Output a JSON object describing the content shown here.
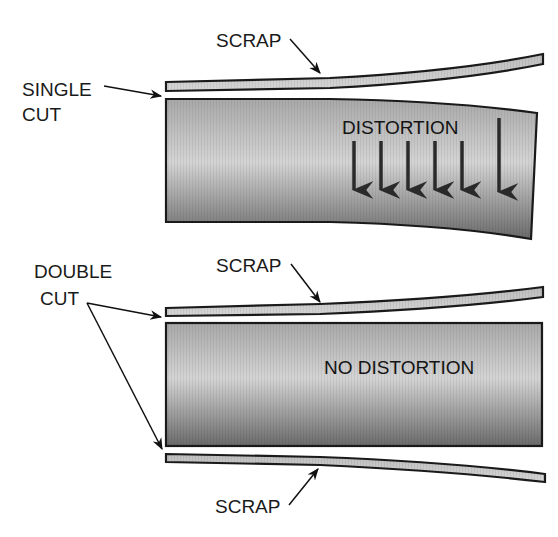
{
  "colors": {
    "stroke": "#1a1a1a",
    "scrap_fill": "#c8c8c8",
    "body_light": "#cfcfcf",
    "body_dark": "#6e6e6e",
    "arrow": "#2a2a2a"
  },
  "top": {
    "cut_label_line1": "SINGLE",
    "cut_label_line2": "CUT",
    "scrap_label": "SCRAP",
    "body_label": "DISTORTION",
    "distortion_arrow_count": 6
  },
  "bottom": {
    "cut_label_line1": "DOUBLE",
    "cut_label_line2": "CUT",
    "scrap_top_label": "SCRAP",
    "scrap_bottom_label": "SCRAP",
    "body_label": "NO DISTORTION"
  }
}
